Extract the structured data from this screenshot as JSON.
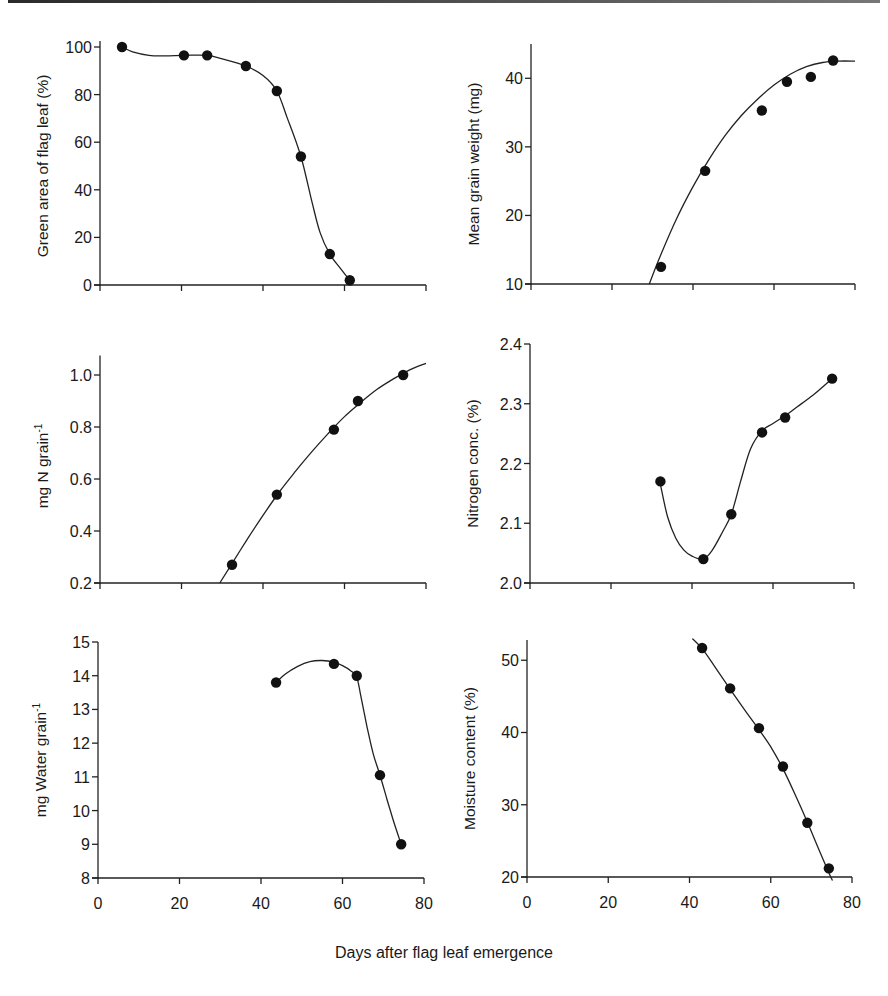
{
  "figure": {
    "shared_xlabel": "Days after flag leaf emergence"
  },
  "chart_data": [
    {
      "id": "green-area",
      "type": "line",
      "title": "",
      "xlabel": "Days after flag leaf emergence",
      "ylabel": "Green area of flag leaf (%)",
      "ylabel_sup": "",
      "xlim": [
        0,
        80
      ],
      "ylim": [
        0,
        100
      ],
      "y_axis_top": 102.5,
      "xticks": [
        0,
        20,
        40,
        60,
        80
      ],
      "xtick_labels_shown": false,
      "yticks": [
        0,
        20,
        40,
        60,
        80,
        100
      ],
      "ytick_labels": [
        "0",
        "20",
        "40",
        "60",
        "80",
        "100"
      ],
      "grid": false,
      "points": {
        "x": [
          5.4,
          20.6,
          26.3,
          35.8,
          43.4,
          49.3,
          56.4,
          61.3
        ],
        "y": [
          100,
          96.5,
          96.5,
          92,
          81.5,
          54,
          13,
          2
        ]
      },
      "curve": {
        "x": [
          5.4,
          8,
          12,
          16,
          20.6,
          26.3,
          30,
          35.8,
          40,
          43.4,
          46,
          49.3,
          52,
          54,
          56.4,
          59,
          61.3
        ],
        "y": [
          100,
          98,
          96.5,
          96.3,
          96.5,
          96.5,
          95,
          92,
          88,
          81.5,
          70,
          54,
          35,
          22,
          13,
          7,
          2
        ]
      },
      "box": {
        "left": 100,
        "right": 426,
        "top": 47,
        "bottom": 285
      }
    },
    {
      "id": "grain-weight",
      "type": "line",
      "title": "",
      "xlabel": "Days after flag leaf emergence",
      "ylabel": "Mean grain weight (mg)",
      "ylabel_sup": "",
      "xlim": [
        0,
        80
      ],
      "ylim": [
        10,
        45
      ],
      "y_axis_top": 45,
      "xticks": [
        0,
        20,
        40,
        60,
        80
      ],
      "xtick_labels_shown": false,
      "yticks": [
        10,
        20,
        30,
        40
      ],
      "ytick_labels": [
        "10",
        "20",
        "30",
        "40"
      ],
      "grid": false,
      "points": {
        "x": [
          32.1,
          43,
          57,
          63.2,
          69.1,
          74.6
        ],
        "y": [
          12.5,
          26.5,
          35.3,
          39.5,
          40.2,
          42.6
        ]
      },
      "curve": {
        "x": [
          29.2,
          32,
          36,
          40,
          44,
          48,
          52,
          56,
          60,
          64,
          68,
          72,
          76,
          80
        ],
        "y": [
          10,
          14.2,
          19.6,
          24.2,
          28.2,
          31.7,
          34.6,
          37,
          39,
          40.6,
          41.7,
          42.3,
          42.5,
          42.5
        ]
      },
      "box": {
        "left": 531,
        "right": 855,
        "top": 44,
        "bottom": 284
      }
    },
    {
      "id": "nitrogen-per-grain",
      "type": "line",
      "title": "",
      "xlabel": "Days after flag leaf emergence",
      "ylabel": "mg N grain",
      "ylabel_sup": "-1",
      "xlim": [
        0,
        80
      ],
      "ylim": [
        0.2,
        1.1
      ],
      "y_axis_top": 1.075,
      "xticks": [
        0,
        20,
        40,
        60,
        80
      ],
      "xtick_labels_shown": false,
      "yticks": [
        0.2,
        0.4,
        0.6,
        0.8,
        1.0
      ],
      "ytick_labels": [
        "0.2",
        "0.4",
        "0.6",
        "0.8",
        "1.0"
      ],
      "grid": false,
      "points": {
        "x": [
          32.4,
          43.4,
          57.4,
          63.3,
          74.4
        ],
        "y": [
          0.27,
          0.54,
          0.79,
          0.9,
          1.0
        ]
      },
      "curve": {
        "x": [
          29.4,
          32,
          36,
          40,
          44,
          48,
          52,
          56,
          60,
          64,
          68,
          72,
          76,
          80
        ],
        "y": [
          0.2,
          0.265,
          0.365,
          0.46,
          0.55,
          0.63,
          0.705,
          0.775,
          0.84,
          0.895,
          0.945,
          0.985,
          1.02,
          1.045
        ]
      },
      "box": {
        "left": 100,
        "right": 426,
        "top": 349,
        "bottom": 583
      }
    },
    {
      "id": "nitrogen-conc",
      "type": "line",
      "title": "",
      "xlabel": "Days after flag leaf emergence",
      "ylabel": "Nitrogen conc. (%)",
      "ylabel_sup": "",
      "xlim": [
        0,
        80
      ],
      "ylim": [
        2.0,
        2.4
      ],
      "y_axis_top": 2.4,
      "xticks": [
        0,
        20,
        40,
        60,
        80
      ],
      "xtick_labels_shown": false,
      "yticks": [
        2.0,
        2.1,
        2.2,
        2.3,
        2.4
      ],
      "ytick_labels": [
        "2.0",
        "2.1",
        "2.2",
        "2.3",
        "2.4"
      ],
      "grid": false,
      "points": {
        "x": [
          32.2,
          42.8,
          49.7,
          57.3,
          63,
          74.6
        ],
        "y": [
          2.17,
          2.04,
          2.115,
          2.252,
          2.277,
          2.342
        ]
      },
      "curve": {
        "x": [
          32.2,
          34,
          36,
          38,
          40,
          42.8,
          45,
          47.5,
          49.7,
          52,
          54.5,
          57.3,
          60,
          63,
          66,
          70,
          74.6
        ],
        "y": [
          2.165,
          2.11,
          2.075,
          2.055,
          2.045,
          2.04,
          2.055,
          2.085,
          2.115,
          2.17,
          2.225,
          2.255,
          2.267,
          2.28,
          2.295,
          2.315,
          2.342
        ]
      },
      "box": {
        "left": 530,
        "right": 854,
        "top": 344,
        "bottom": 583
      }
    },
    {
      "id": "water-per-grain",
      "type": "line",
      "title": "",
      "xlabel": "Days after flag leaf emergence",
      "ylabel": "mg Water grain",
      "ylabel_sup": "-1",
      "xlim": [
        0,
        80
      ],
      "ylim": [
        8,
        15
      ],
      "y_axis_top": 15,
      "xticks": [
        0,
        20,
        40,
        60,
        80
      ],
      "xtick_labels_shown": true,
      "xtick_labels": [
        "0",
        "20",
        "40",
        "60",
        "80"
      ],
      "yticks": [
        8,
        9,
        10,
        11,
        12,
        13,
        14,
        15
      ],
      "ytick_labels": [
        "8",
        "9",
        "10",
        "11",
        "12",
        "13",
        "14",
        "15"
      ],
      "grid": false,
      "points": {
        "x": [
          43.7,
          57.9,
          63.5,
          69.2,
          74.4
        ],
        "y": [
          13.8,
          14.35,
          14.0,
          11.05,
          9.0
        ]
      },
      "curve": {
        "x": [
          43.7,
          46,
          49,
          52,
          55,
          57.9,
          60,
          62,
          63.5,
          64.5,
          66,
          67.5,
          69.2,
          71,
          72.5,
          74.4
        ],
        "y": [
          13.8,
          14.05,
          14.28,
          14.42,
          14.45,
          14.4,
          14.3,
          14.15,
          13.95,
          13.4,
          12.5,
          11.7,
          11.05,
          10.3,
          9.7,
          9.0
        ]
      },
      "box": {
        "left": 98,
        "right": 424,
        "top": 642,
        "bottom": 878
      }
    },
    {
      "id": "moisture-content",
      "type": "line",
      "title": "",
      "xlabel": "Days after flag leaf emergence",
      "ylabel": "Moisture content (%)",
      "ylabel_sup": "",
      "xlim": [
        0,
        80
      ],
      "ylim": [
        20,
        52.8
      ],
      "y_axis_top": 52.8,
      "xticks": [
        0,
        20,
        40,
        60,
        80
      ],
      "xtick_labels_shown": true,
      "xtick_labels": [
        "0",
        "20",
        "40",
        "60",
        "80"
      ],
      "yticks": [
        20,
        30,
        40,
        50
      ],
      "ytick_labels": [
        "20",
        "30",
        "40",
        "50"
      ],
      "grid": false,
      "points": {
        "x": [
          43.1,
          50,
          57.1,
          63,
          69,
          74.3
        ],
        "y": [
          51.7,
          46.1,
          40.6,
          35.3,
          27.5,
          21.2
        ]
      },
      "curve": {
        "x": [
          40.7,
          43.1,
          46,
          50,
          54,
          57.1,
          60,
          63,
          66,
          69,
          72,
          74.3,
          75.2
        ],
        "y": [
          53,
          51.6,
          49.3,
          46.0,
          42.8,
          40.4,
          38.0,
          35.0,
          31.4,
          27.6,
          23.6,
          20.6,
          19.5
        ]
      },
      "box": {
        "left": 527,
        "right": 852,
        "top": 640,
        "bottom": 877
      }
    }
  ]
}
